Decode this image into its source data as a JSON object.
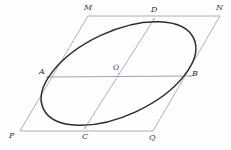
{
  "figure": {
    "background_color": "#fefefe",
    "canvas": {
      "width": 231,
      "height": 150
    }
  },
  "style": {
    "ellipse_stroke": "#2b2b33",
    "ellipse_stroke_width": 1.5,
    "parallelogram_stroke": "#9a9aa2",
    "parallelogram_stroke_width": 0.8,
    "diagonal_stroke": "#9a9aa2",
    "diagonal_stroke_width": 0.8,
    "chord_stroke": "#8a8a92",
    "chord_stroke_width": 0.8,
    "label_color": "#3a3a42"
  },
  "parallelogram": {
    "name": "MNQP",
    "vertices": [
      {
        "id": "M",
        "label": "M",
        "x": 88,
        "y": 16,
        "label_x": 84,
        "label_y": 4
      },
      {
        "id": "N",
        "label": "N",
        "x": 220,
        "y": 16,
        "label_x": 216,
        "label_y": 4
      },
      {
        "id": "Q",
        "label": "Q",
        "x": 153,
        "y": 131,
        "label_x": 149,
        "label_y": 134
      },
      {
        "id": "P",
        "label": "P",
        "x": 20,
        "y": 131,
        "label_x": 9,
        "label_y": 132
      }
    ]
  },
  "ellipse": {
    "center": {
      "x": 118.5,
      "y": 73.5
    },
    "semi_major": 83,
    "semi_minor": 42,
    "rotation_deg": -25
  },
  "tangent_points": [
    {
      "id": "A",
      "label": "A",
      "x": 47,
      "y": 77,
      "label_x": 39,
      "label_y": 68,
      "side": "PM"
    },
    {
      "id": "B",
      "label": "B",
      "x": 191,
      "y": 76,
      "label_x": 192,
      "label_y": 70,
      "side": "NQ"
    },
    {
      "id": "C",
      "label": "C",
      "x": 85,
      "y": 128,
      "label_x": 82,
      "label_y": 133,
      "side": "PQ"
    },
    {
      "id": "D",
      "label": "D",
      "x": 154,
      "y": 19,
      "label_x": 151,
      "label_y": 6,
      "side": "MN"
    }
  ],
  "center_point": {
    "id": "O",
    "label": "O",
    "x": 118.5,
    "y": 73.5,
    "label_x": 113,
    "label_y": 64
  },
  "chords": [
    {
      "id": "AB",
      "from": "A",
      "to": "B",
      "description": "horizontal conjugate diameter"
    },
    {
      "id": "CD",
      "from": "C",
      "to": "D",
      "description": "slanted conjugate diameter"
    }
  ]
}
